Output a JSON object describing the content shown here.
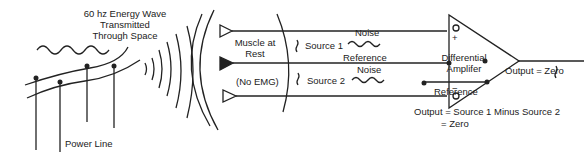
{
  "diagram": {
    "title_lines": [
      "60 hz Energy Wave",
      "Transmitted",
      "Through Space"
    ],
    "power_line_label": "Power Line",
    "muscle_label_lines": [
      "Muscle at",
      "Rest"
    ],
    "no_emg_label": "(No EMG)",
    "source1_label": "Source 1",
    "source2_label": "Source 2",
    "noise1_label": "Noise",
    "noise2_label": "Noise",
    "reference_label_mid": "Reference",
    "amplifier_label_lines": [
      "Differential",
      "Amplifer"
    ],
    "plus_sign": "+",
    "minus_sign": "−",
    "reference_label_out": "Reference",
    "output_label": "Output = Zero",
    "equation_line1": "Output = Source 1 Minus Source 2",
    "equation_line2": "= Zero"
  }
}
